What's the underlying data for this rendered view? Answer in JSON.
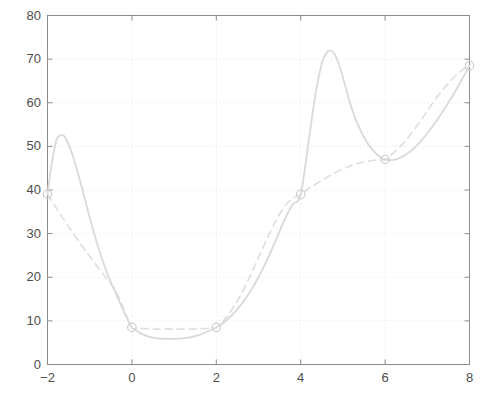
{
  "chart_data": {
    "type": "line",
    "title": "",
    "subtitle": "",
    "xlabel": "",
    "ylabel": "",
    "xlim": [
      -2,
      8
    ],
    "ylim": [
      0,
      80
    ],
    "xticks": [
      -2,
      0,
      2,
      4,
      6,
      8
    ],
    "yticks": [
      0,
      10,
      20,
      30,
      40,
      50,
      60,
      70,
      80
    ],
    "xtick_labels": [
      "−2",
      "0",
      "2",
      "4",
      "6",
      "8"
    ],
    "ytick_labels": [
      "0",
      "10",
      "20",
      "30",
      "40",
      "50",
      "60",
      "70",
      "80"
    ],
    "grid": true,
    "grid_style": "dotted",
    "legend": null,
    "legend_position": "none",
    "annotations": [],
    "data_points": {
      "name": "knots",
      "marker": "circle-open",
      "x": [
        -2,
        0,
        2,
        4,
        6,
        8
      ],
      "y": [
        39,
        8.5,
        8.5,
        39,
        47,
        68.5
      ]
    },
    "series": [
      {
        "name": "spline interpolant",
        "style": "solid",
        "color": "#d9d9d9",
        "comment": "oscillating interpolating curve with overshoot peaks",
        "x": [
          -2.0,
          -1.9,
          -1.8,
          -1.75,
          -1.7,
          -1.65,
          -1.6,
          -1.5,
          -1.4,
          -1.3,
          -1.2,
          -1.1,
          -1.0,
          -0.9,
          -0.8,
          -0.7,
          -0.6,
          -0.5,
          -0.4,
          -0.3,
          -0.2,
          -0.1,
          0.0,
          0.2,
          0.4,
          0.6,
          0.8,
          1.0,
          1.2,
          1.4,
          1.6,
          1.8,
          2.0,
          2.2,
          2.4,
          2.6,
          2.8,
          3.0,
          3.2,
          3.4,
          3.6,
          3.8,
          4.0,
          4.2,
          4.35,
          4.5,
          4.6,
          4.7,
          4.8,
          4.9,
          5.0,
          5.2,
          5.4,
          5.6,
          5.8,
          6.0,
          6.2,
          6.4,
          6.6,
          6.8,
          7.0,
          7.2,
          7.4,
          7.6,
          7.8,
          8.0
        ],
        "y": [
          39.0,
          46.0,
          51.0,
          52.2,
          52.5,
          52.6,
          52.3,
          50.5,
          47.8,
          44.6,
          41.1,
          37.4,
          33.7,
          30.2,
          27.0,
          24.0,
          21.3,
          18.9,
          16.7,
          14.5,
          12.3,
          10.3,
          8.5,
          7.2,
          6.4,
          6.0,
          5.9,
          5.9,
          6.0,
          6.3,
          6.8,
          7.6,
          8.5,
          9.8,
          11.6,
          13.9,
          16.7,
          20.0,
          23.9,
          28.2,
          32.8,
          36.6,
          39.0,
          52.0,
          62.0,
          69.0,
          71.3,
          72.0,
          71.2,
          69.0,
          65.8,
          59.0,
          54.0,
          50.5,
          48.2,
          47.0,
          46.9,
          47.6,
          48.9,
          50.7,
          53.0,
          55.6,
          58.5,
          61.6,
          65.0,
          68.5
        ]
      },
      {
        "name": "shape-preserving curve",
        "style": "dashed",
        "color": "#dedede",
        "comment": "monotone / smoother curve through the same knots",
        "x": [
          -2.0,
          -1.8,
          -1.6,
          -1.4,
          -1.2,
          -1.0,
          -0.8,
          -0.6,
          -0.4,
          -0.2,
          0.0,
          0.2,
          0.4,
          0.6,
          0.8,
          1.0,
          1.2,
          1.4,
          1.6,
          1.8,
          2.0,
          2.2,
          2.4,
          2.6,
          2.8,
          3.0,
          3.2,
          3.4,
          3.6,
          3.8,
          4.0,
          4.2,
          4.4,
          4.6,
          4.8,
          5.0,
          5.2,
          5.4,
          5.6,
          5.8,
          6.0,
          6.2,
          6.4,
          6.6,
          6.8,
          7.0,
          7.2,
          7.4,
          7.6,
          7.8,
          8.0
        ],
        "y": [
          39.0,
          36.0,
          33.0,
          30.2,
          27.4,
          24.8,
          22.2,
          19.7,
          17.2,
          12.9,
          8.5,
          8.3,
          8.2,
          8.1,
          8.1,
          8.1,
          8.1,
          8.1,
          8.2,
          8.3,
          8.5,
          10.4,
          13.0,
          16.3,
          20.3,
          24.5,
          28.8,
          32.7,
          36.0,
          38.0,
          39.0,
          40.4,
          41.6,
          42.8,
          43.9,
          44.8,
          45.6,
          46.2,
          46.6,
          46.9,
          47.0,
          48.5,
          50.4,
          52.7,
          55.3,
          58.1,
          60.9,
          63.4,
          65.5,
          67.3,
          68.5
        ]
      }
    ]
  },
  "axes": {
    "box_color": "#808080",
    "grid_color": "#e8dede",
    "background": "#ffffff"
  }
}
